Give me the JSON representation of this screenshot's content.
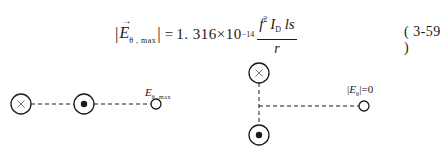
{
  "equation": {
    "lhs_symbol": "E",
    "lhs_vector_arrow": "⃗",
    "lhs_subscript": "θ , max",
    "abs_open": "|",
    "abs_close": "|",
    "equals": "=",
    "coefficient": "1. 316×10",
    "exponent": "−14",
    "numerator": {
      "f": "f",
      "f_power": "2",
      "I": "I",
      "I_subscript": "D",
      "rest": "ls"
    },
    "denominator": "r",
    "number": "( 3-59 )"
  },
  "diagram": {
    "left": {
      "nodes": [
        {
          "type": "current-into-page",
          "glyph": "×",
          "cx": 21,
          "cy": 104,
          "r": 10
        },
        {
          "type": "current-out-of-page",
          "glyph": "•",
          "cx": 84,
          "cy": 104,
          "r": 10
        },
        {
          "type": "observation-point",
          "cx": 156,
          "cy": 104,
          "r": 5
        }
      ],
      "label": {
        "symbol": "E",
        "subscript": "θ ,max"
      }
    },
    "right": {
      "nodes": [
        {
          "type": "current-into-page",
          "glyph": "×",
          "cx": 259,
          "cy": 73,
          "r": 10
        },
        {
          "type": "current-out-of-page",
          "glyph": "•",
          "cx": 259,
          "cy": 135,
          "r": 10
        },
        {
          "type": "observation-point",
          "cx": 364,
          "cy": 106,
          "r": 5
        }
      ],
      "label": {
        "abs_open": "|",
        "symbol": "E",
        "subscript": "θ",
        "abs_close": "|",
        "value": "=0"
      }
    }
  },
  "colors": {
    "ink": "#1a1a1a",
    "cross": "#777777",
    "background": "#ffffff"
  }
}
